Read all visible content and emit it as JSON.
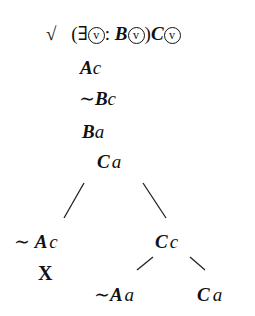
{
  "tree": {
    "check_mark": "√",
    "premise": {
      "open_paren": "(",
      "quantifier": "∃",
      "var": "v",
      "colon": ":",
      "restrictor_pred": "B",
      "close_paren": ")",
      "scope_pred": "C"
    },
    "lines": [
      {
        "pred": "A",
        "const": "c",
        "neg": ""
      },
      {
        "pred": "B",
        "const": "c",
        "neg": "∼"
      },
      {
        "pred": "B",
        "const": "a",
        "neg": ""
      },
      {
        "pred": "C",
        "const": "a",
        "neg": ""
      }
    ],
    "left_branch": {
      "node": {
        "neg": "∼",
        "pred": "A",
        "const": "c"
      },
      "closed_mark": "X"
    },
    "right_branch": {
      "node": {
        "pred": "C",
        "const": "c"
      },
      "children": [
        {
          "neg": "∼",
          "pred": "A",
          "const": "a"
        },
        {
          "pred": "C",
          "const": "a"
        }
      ]
    }
  }
}
